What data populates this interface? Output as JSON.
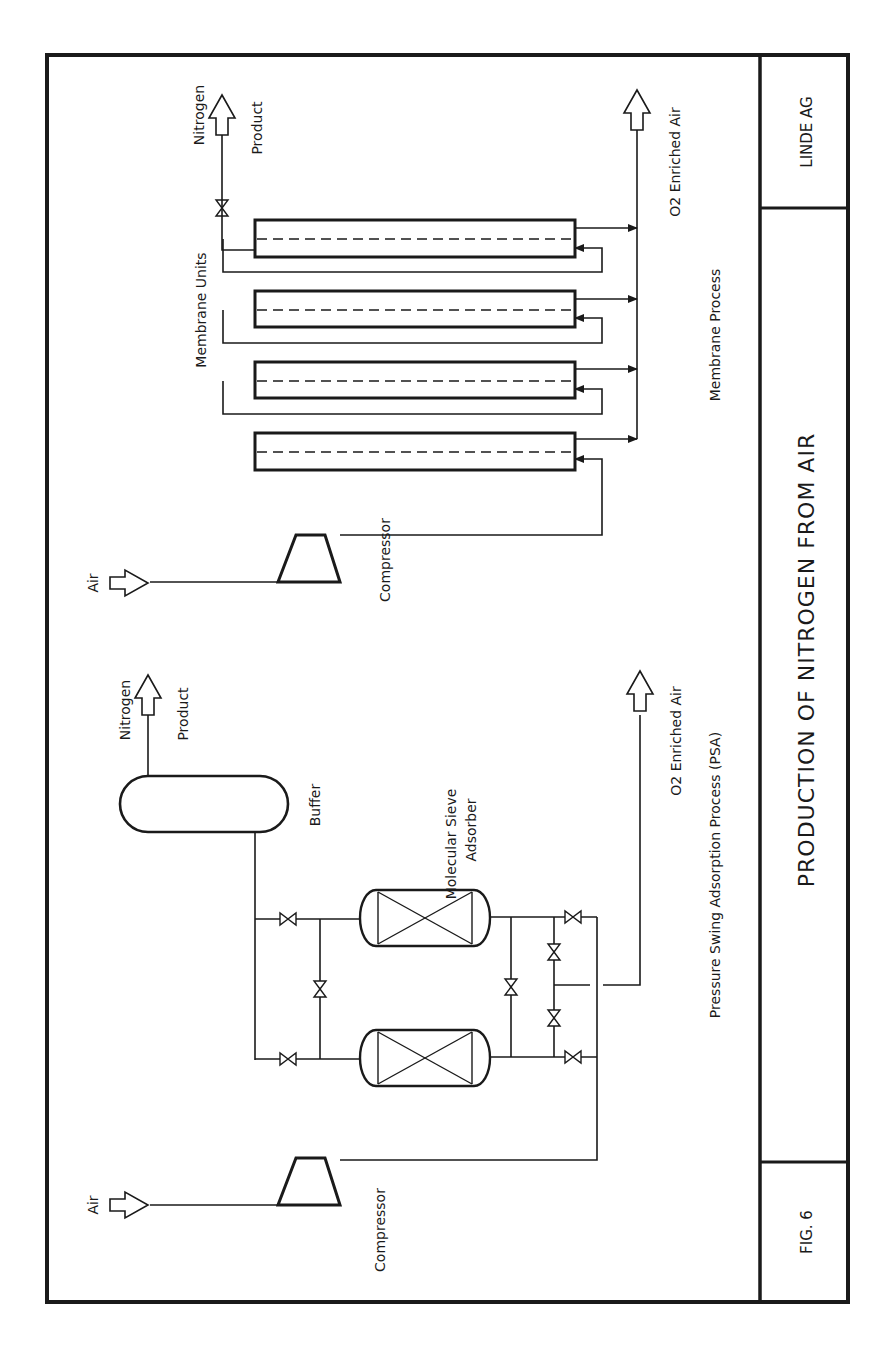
{
  "title_block": {
    "company": "LINDE AG",
    "title": "PRODUCTION OF NITROGEN FROM AIR",
    "figure": "FIG. 6"
  },
  "membrane_process": {
    "section_label": "Membrane Process",
    "units_label": "Membrane Units",
    "air_label": "Air",
    "compressor_label": "Compressor",
    "product_label_1": "Nitrogen",
    "product_label_2": "Product",
    "o2_label": "O2 Enriched Air",
    "unit_count": 4
  },
  "psa_process": {
    "section_label": "Pressure Swing Adsorption Process (PSA)",
    "air_label": "Air",
    "compressor_label": "Compressor",
    "buffer_label": "Buffer",
    "adsorber_label_1": "Molecular Sieve",
    "adsorber_label_2": "Adsorber",
    "product_label_1": "Nitrogen",
    "product_label_2": "Product",
    "o2_label": "O2 Enriched Air"
  },
  "colors": {
    "ink": "#1a1a1a",
    "paper": "#ffffff"
  }
}
